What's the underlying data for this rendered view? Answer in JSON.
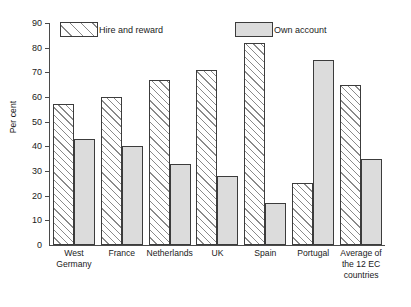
{
  "chart_data": {
    "type": "bar",
    "title": "",
    "xlabel": "",
    "ylabel": "Per cent",
    "ylim": [
      0,
      90
    ],
    "ytick_step": 10,
    "yticks": [
      0,
      10,
      20,
      30,
      40,
      50,
      60,
      70,
      80,
      90
    ],
    "grid": false,
    "legend_position": "top-inside",
    "categories": [
      "West\nGermany",
      "France",
      "Netherlands",
      "UK",
      "Spain",
      "Portugal",
      "Average of\nthe 12 EC\ncountries"
    ],
    "series": [
      {
        "name": "Hire and reward",
        "fill": "hatched",
        "color": "#ffffff",
        "values": [
          57,
          60,
          67,
          71,
          82,
          25,
          65
        ]
      },
      {
        "name": "Own account",
        "fill": "solid",
        "color": "#dcdcdc",
        "values": [
          43,
          40,
          33,
          28,
          17,
          75,
          35
        ]
      }
    ]
  },
  "axis": {
    "line_color": "#4a4a4a"
  },
  "legend": {
    "entries": [
      {
        "label": "Hire and reward",
        "swatch": "hatched-swatch"
      },
      {
        "label": "Own account",
        "swatch": "solid-swatch"
      }
    ]
  }
}
